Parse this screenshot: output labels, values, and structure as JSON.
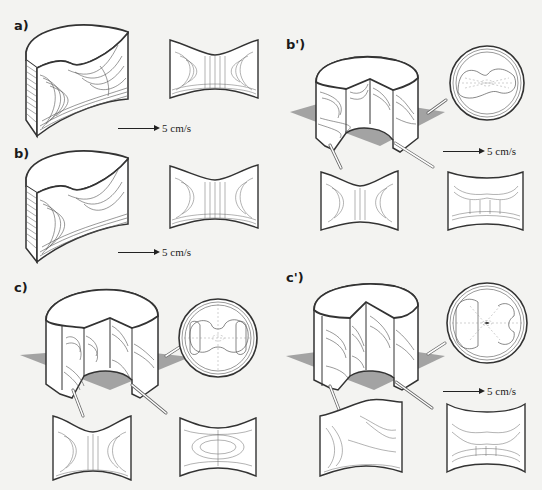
{
  "figure": {
    "background": "#f3f3f1",
    "line_color": "#333333",
    "plane_color": "#9a9a9a",
    "panels": [
      {
        "id": "a",
        "label": "a)",
        "views": [
          "cutaway-cylinder",
          "meridional-section"
        ],
        "scale_label": "5 cm/s"
      },
      {
        "id": "b",
        "label": "b)",
        "views": [
          "cutaway-cylinder",
          "meridional-section"
        ],
        "scale_label": "5 cm/s"
      },
      {
        "id": "b_prime",
        "label": "b')",
        "views": [
          "cutaway-cylinder-with-plane",
          "horizontal-section-circle",
          "meridional-section-left",
          "meridional-section-right"
        ],
        "scale_label": "5 cm/s"
      },
      {
        "id": "c",
        "label": "c)",
        "views": [
          "cutaway-cylinder-with-plane",
          "horizontal-section-circle",
          "meridional-section-left",
          "meridional-section-right"
        ],
        "scale_label": ""
      },
      {
        "id": "c_prime",
        "label": "c')",
        "views": [
          "cutaway-cylinder-with-plane",
          "horizontal-section-circle",
          "meridional-section-left",
          "meridional-section-right"
        ],
        "scale_label": "5 cm/s"
      }
    ]
  }
}
